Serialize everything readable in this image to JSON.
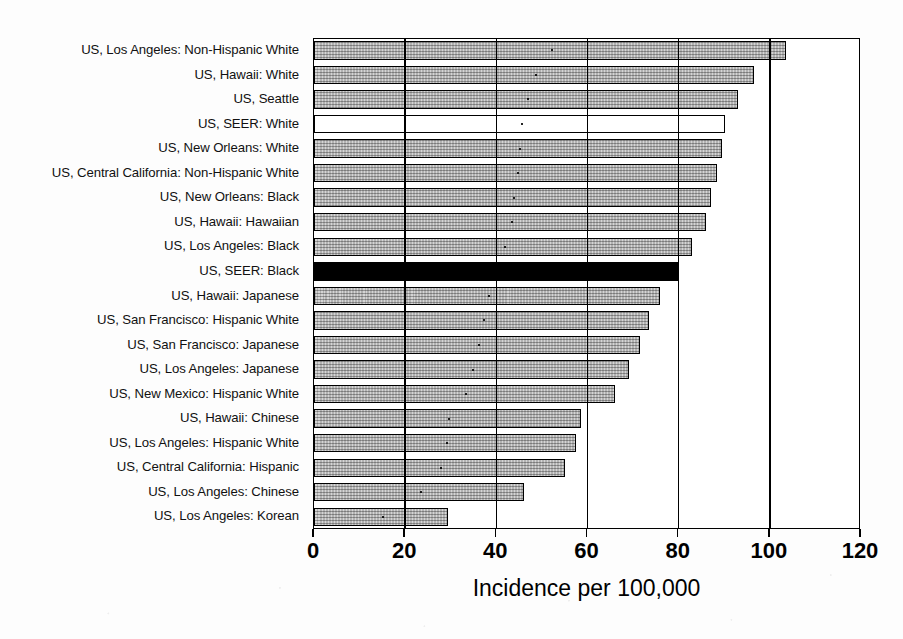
{
  "figure": {
    "cropped_header_text": "",
    "background_color": "#ffffff"
  },
  "axis": {
    "x_title": "Incidence per 100,000",
    "x_ticks": [
      "0",
      "20",
      "40",
      "60",
      "80",
      "100",
      "120"
    ]
  },
  "colors": {
    "bar_default": "#b2b2b2",
    "bar_highlight_black": "#000000",
    "bar_highlight_white": "#ffffff",
    "axis": "#000000"
  },
  "chart_data": {
    "type": "bar",
    "orientation": "horizontal",
    "title": "",
    "xlabel": "Incidence per 100,000",
    "ylabel": "",
    "xlim": [
      0,
      120
    ],
    "xticks": [
      0,
      20,
      40,
      60,
      80,
      100,
      120
    ],
    "grid": true,
    "legend": null,
    "categories": [
      "US, Los Angeles: Non-Hispanic White",
      "US, Hawaii: White",
      "US, Seattle",
      "US, SEER: White",
      "US, New Orleans: White",
      "US, Central California: Non-Hispanic White",
      "US, New Orleans: Black",
      "US, Hawaii: Hawaiian",
      "US, Los Angeles: Black",
      "US, SEER: Black",
      "US, Hawaii: Japanese",
      "US, San Francisco: Hispanic White",
      "US, San Francisco: Japanese",
      "US, Los Angeles: Japanese",
      "US, New Mexico: Hispanic White",
      "US, Hawaii: Chinese",
      "US, Los Angeles: Hispanic White",
      "US, Central California: Hispanic",
      "US, Los Angeles: Chinese",
      "US, Los Angeles: Korean"
    ],
    "values": [
      103.5,
      96.5,
      93.0,
      90.2,
      89.5,
      88.5,
      87.0,
      86.0,
      83.0,
      80.0,
      76.0,
      73.5,
      71.5,
      69.0,
      66.0,
      58.5,
      57.5,
      55.0,
      46.0,
      29.5
    ],
    "bar_styles": [
      "grey",
      "grey",
      "grey",
      "white",
      "grey",
      "grey",
      "grey",
      "grey",
      "grey",
      "black",
      "grey",
      "grey",
      "grey",
      "grey",
      "grey",
      "grey",
      "grey",
      "grey",
      "grey",
      "grey"
    ]
  }
}
